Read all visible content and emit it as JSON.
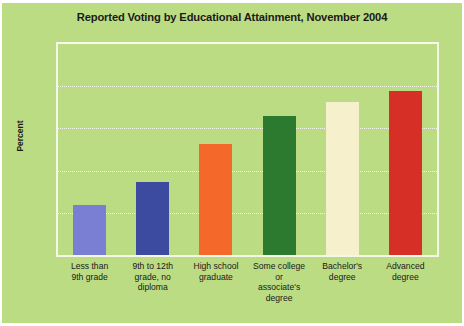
{
  "figure": {
    "background_color": "#bcdc84",
    "plot_border_color": "#f4f7e8",
    "gridline_color": "#f2f6e4"
  },
  "chart_data": {
    "type": "bar",
    "title": "Reported Voting by Educational Attainment, November 2004",
    "xlabel": "",
    "ylabel": "Percent",
    "ylim": [
      0,
      100
    ],
    "yticks": [
      0,
      20,
      40,
      60,
      80,
      100
    ],
    "grid": true,
    "legend": "none",
    "categories": [
      "Less than\n9th grade",
      "9th to 12th\ngrade, no\ndiploma",
      "High school\ngraduate",
      "Some college\nor\nassociate's\ndegree",
      "Bachelor's\ndegree",
      "Advanced\ndegree"
    ],
    "category_lines": [
      [
        "Less than",
        "9th grade"
      ],
      [
        "9th to 12th",
        "grade, no",
        "diploma"
      ],
      [
        "High school",
        "graduate"
      ],
      [
        "Some college",
        "or",
        "associate's",
        "degree"
      ],
      [
        "Bachelor's",
        "degree"
      ],
      [
        "Advanced",
        "degree"
      ]
    ],
    "values": [
      23.6,
      34.6,
      52.4,
      66.1,
      72.6,
      77.5
    ],
    "colors": [
      "#7b7fd4",
      "#3c4ba0",
      "#f4682a",
      "#2b7a30",
      "#f7f0cd",
      "#d62f26"
    ]
  }
}
